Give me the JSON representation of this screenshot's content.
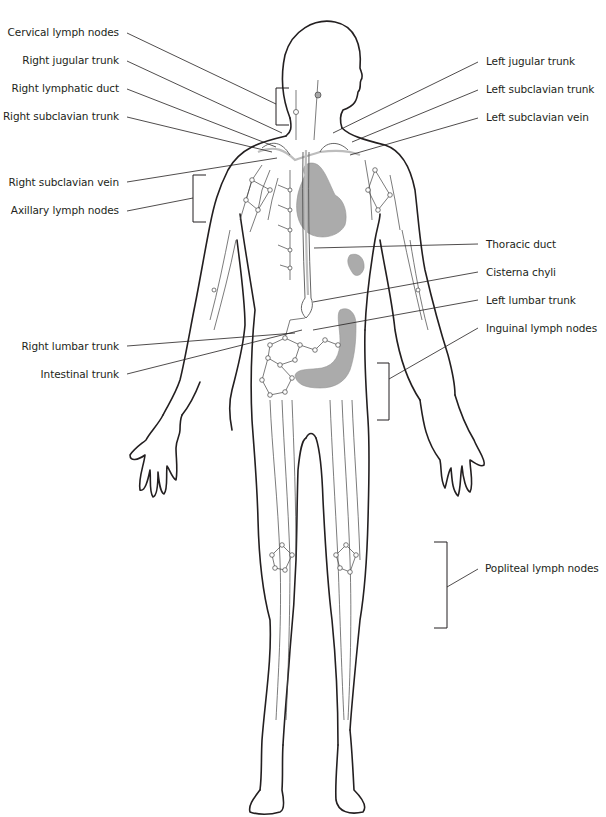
{
  "diagram": {
    "colors": {
      "outline": "#231f20",
      "vessel": "#444444",
      "organ_fill": "#a7a7a7",
      "duct": "#cfcfcf",
      "background": "#ffffff"
    },
    "labels_left": [
      {
        "id": "cervical-lymph-nodes",
        "text": "Cervical lymph nodes"
      },
      {
        "id": "right-jugular-trunk",
        "text": "Right jugular trunk"
      },
      {
        "id": "right-lymphatic-duct",
        "text": "Right lymphatic duct"
      },
      {
        "id": "right-subclavian-trunk",
        "text": "Right subclavian trunk"
      },
      {
        "id": "right-subclavian-vein",
        "text": "Right subclavian vein"
      },
      {
        "id": "axillary-lymph-nodes",
        "text": "Axillary lymph nodes"
      },
      {
        "id": "right-lumbar-trunk",
        "text": "Right lumbar trunk"
      },
      {
        "id": "intestinal-trunk",
        "text": "Intestinal trunk"
      }
    ],
    "labels_right": [
      {
        "id": "left-jugular-trunk",
        "text": "Left jugular trunk"
      },
      {
        "id": "left-subclavian-trunk",
        "text": "Left subclavian trunk"
      },
      {
        "id": "left-subclavian-vein",
        "text": "Left subclavian vein"
      },
      {
        "id": "thoracic-duct",
        "text": "Thoracic duct"
      },
      {
        "id": "cisterna-chyli",
        "text": "Cisterna chyli"
      },
      {
        "id": "left-lumbar-trunk",
        "text": "Left lumbar trunk"
      },
      {
        "id": "inguinal-lymph-nodes",
        "text": "Inguinal lymph nodes"
      },
      {
        "id": "popliteal-lymph-nodes",
        "text": "Popliteal lymph nodes"
      }
    ]
  }
}
